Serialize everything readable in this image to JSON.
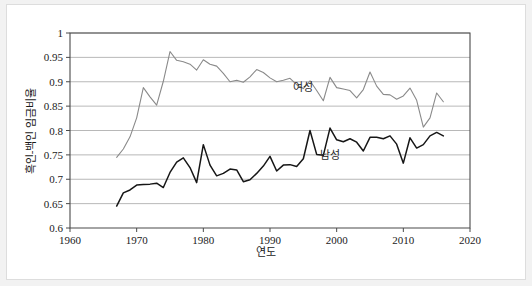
{
  "chart_data": {
    "type": "line",
    "title": "",
    "xlabel": "연도",
    "ylabel": "흑인-백인 임금비율",
    "xlim": [
      1960,
      2020
    ],
    "ylim": [
      0.6,
      1.0
    ],
    "xticks": [
      1960,
      1970,
      1980,
      1990,
      2000,
      2010,
      2020
    ],
    "xtick_labels": [
      "1960",
      "1970",
      "1980",
      "1990",
      "2000",
      "2010",
      "2020"
    ],
    "yticks": [
      0.6,
      0.65,
      0.7,
      0.75,
      0.8,
      0.85,
      0.9,
      0.95,
      1
    ],
    "ytick_labels": [
      "0.6",
      "0.65",
      "0.7",
      "0.75",
      "0.8",
      "0.85",
      "0.9",
      "0.95",
      "1"
    ],
    "grid": "horizontal",
    "legend": "inline-annotation",
    "x": [
      1967,
      1968,
      1969,
      1970,
      1971,
      1972,
      1973,
      1974,
      1975,
      1976,
      1977,
      1978,
      1979,
      1980,
      1981,
      1982,
      1983,
      1984,
      1985,
      1986,
      1987,
      1988,
      1989,
      1990,
      1991,
      1992,
      1993,
      1994,
      1995,
      1996,
      1997,
      1998,
      1999,
      2000,
      2001,
      2002,
      2003,
      2004,
      2005,
      2006,
      2007,
      2008,
      2009,
      2010,
      2011,
      2012,
      2013,
      2014,
      2015,
      2016
    ],
    "series": [
      {
        "name": "여성",
        "color": "#8a8a8a",
        "label_x": 1995,
        "label_y": 0.882,
        "values": [
          0.745,
          0.762,
          0.787,
          0.826,
          0.888,
          0.869,
          0.852,
          0.901,
          0.962,
          0.944,
          0.941,
          0.936,
          0.924,
          0.945,
          0.936,
          0.932,
          0.917,
          0.9,
          0.903,
          0.899,
          0.91,
          0.925,
          0.919,
          0.908,
          0.9,
          0.903,
          0.907,
          0.894,
          0.886,
          0.902,
          0.882,
          0.861,
          0.909,
          0.888,
          0.885,
          0.882,
          0.867,
          0.884,
          0.92,
          0.891,
          0.874,
          0.873,
          0.864,
          0.871,
          0.887,
          0.862,
          0.807,
          0.826,
          0.877,
          0.859
        ]
      },
      {
        "name": "남성",
        "color": "#161616",
        "label_x": 1999,
        "label_y": 0.742,
        "values": [
          0.645,
          0.672,
          0.678,
          0.688,
          0.689,
          0.69,
          0.692,
          0.683,
          0.714,
          0.735,
          0.744,
          0.724,
          0.693,
          0.771,
          0.729,
          0.707,
          0.712,
          0.721,
          0.719,
          0.695,
          0.699,
          0.712,
          0.727,
          0.747,
          0.717,
          0.729,
          0.73,
          0.726,
          0.742,
          0.8,
          0.751,
          0.749,
          0.805,
          0.781,
          0.777,
          0.783,
          0.776,
          0.758,
          0.786,
          0.786,
          0.783,
          0.789,
          0.772,
          0.733,
          0.785,
          0.764,
          0.771,
          0.789,
          0.796,
          0.789
        ]
      }
    ]
  }
}
